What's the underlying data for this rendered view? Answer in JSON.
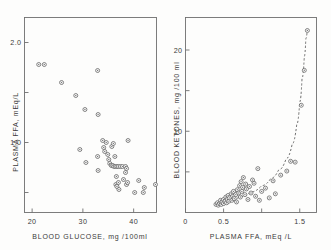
{
  "figure": {
    "background_color": "#fdfdfc",
    "axis_color": "#6f6f6f",
    "marker_color": "#5c5c5c",
    "curve_color": "#555555"
  },
  "chart_data": [
    {
      "type": "scatter",
      "panel": "left",
      "title": "",
      "xlabel": "BLOOD GLUCOSE, mg /100ml",
      "ylabel": "PLASMA FFA, mEq/L",
      "xlim": [
        18.5,
        44.5
      ],
      "ylim": [
        0.3,
        2.25
      ],
      "xticks": [
        20,
        30,
        40
      ],
      "xticklabels": [
        "20",
        "30",
        "40"
      ],
      "yticks": [
        0.5,
        1.0,
        1.5,
        2.0
      ],
      "yticklabels": [
        "",
        "1.0",
        "",
        "2.0"
      ],
      "grid": false,
      "legend": "none",
      "points": [
        [
          21.3,
          1.78
        ],
        [
          22.4,
          1.78
        ],
        [
          25.8,
          1.6
        ],
        [
          28.6,
          1.47
        ],
        [
          30.4,
          1.33
        ],
        [
          32.9,
          1.72
        ],
        [
          33.0,
          1.28
        ],
        [
          29.4,
          0.93
        ],
        [
          30.6,
          0.8
        ],
        [
          32.9,
          0.86
        ],
        [
          33.9,
          1.02
        ],
        [
          34.1,
          0.95
        ],
        [
          34.3,
          0.91
        ],
        [
          34.6,
          1.0
        ],
        [
          34.9,
          0.88
        ],
        [
          35.1,
          0.83
        ],
        [
          35.3,
          0.79
        ],
        [
          35.6,
          0.77
        ],
        [
          35.9,
          0.77
        ],
        [
          36.1,
          0.76
        ],
        [
          36.4,
          0.76
        ],
        [
          36.7,
          0.76
        ],
        [
          37.0,
          0.76
        ],
        [
          37.4,
          0.76
        ],
        [
          37.8,
          0.76
        ],
        [
          38.4,
          0.76
        ],
        [
          33.0,
          0.72
        ],
        [
          35.7,
          0.96
        ],
        [
          36.0,
          0.99
        ],
        [
          36.3,
          0.86
        ],
        [
          36.6,
          0.66
        ],
        [
          36.5,
          0.58
        ],
        [
          36.7,
          0.56
        ],
        [
          37.0,
          0.6
        ],
        [
          37.1,
          0.53
        ],
        [
          38.0,
          0.63
        ],
        [
          38.4,
          0.7
        ],
        [
          38.6,
          0.58
        ],
        [
          38.8,
          0.6
        ],
        [
          38.9,
          1.02
        ],
        [
          38.6,
          0.74
        ],
        [
          40.2,
          0.5
        ],
        [
          41.0,
          0.62
        ],
        [
          41.9,
          0.5
        ],
        [
          42.1,
          0.55
        ],
        [
          44.3,
          0.58
        ]
      ]
    },
    {
      "type": "scatter",
      "panel": "right",
      "title": "",
      "xlabel": "PLASMA FFA, mEq /L",
      "ylabel": "BLOOD KETONES, mg /100 ml",
      "xlim": [
        0.0,
        1.72
      ],
      "ylim": [
        0,
        24
      ],
      "xticks": [
        0,
        0.5,
        1.0,
        1.5
      ],
      "xticklabels": [
        "0",
        "0.5",
        "",
        "1.5"
      ],
      "yticks": [
        5,
        10,
        15,
        20
      ],
      "yticklabels": [
        "",
        "10",
        "",
        "20"
      ],
      "grid": false,
      "legend": "none",
      "fit_curve": {
        "style": "dashed",
        "description": "exponential rise fitted through scatter",
        "points": [
          [
            0.42,
            0.9
          ],
          [
            0.55,
            1.3
          ],
          [
            0.7,
            1.9
          ],
          [
            0.85,
            2.5
          ],
          [
            1.0,
            3.3
          ],
          [
            1.12,
            4.2
          ],
          [
            1.22,
            5.2
          ],
          [
            1.32,
            6.6
          ],
          [
            1.4,
            8.4
          ],
          [
            1.46,
            10.8
          ],
          [
            1.5,
            13.6
          ],
          [
            1.53,
            16.5
          ],
          [
            1.56,
            19.2
          ],
          [
            1.58,
            21.4
          ],
          [
            1.6,
            22.6
          ]
        ]
      },
      "points": [
        [
          0.4,
          1.0
        ],
        [
          0.42,
          1.2
        ],
        [
          0.43,
          0.9
        ],
        [
          0.45,
          1.1
        ],
        [
          0.46,
          1.5
        ],
        [
          0.47,
          1.0
        ],
        [
          0.48,
          1.3
        ],
        [
          0.5,
          1.6
        ],
        [
          0.5,
          1.1
        ],
        [
          0.52,
          1.4
        ],
        [
          0.53,
          1.9
        ],
        [
          0.54,
          1.2
        ],
        [
          0.55,
          1.6
        ],
        [
          0.56,
          2.1
        ],
        [
          0.57,
          1.4
        ],
        [
          0.58,
          1.8
        ],
        [
          0.6,
          2.3
        ],
        [
          0.61,
          1.5
        ],
        [
          0.62,
          2.0
        ],
        [
          0.63,
          2.6
        ],
        [
          0.64,
          1.7
        ],
        [
          0.66,
          2.2
        ],
        [
          0.67,
          1.3
        ],
        [
          0.68,
          2.8
        ],
        [
          0.7,
          2.4
        ],
        [
          0.71,
          3.3
        ],
        [
          0.72,
          1.9
        ],
        [
          0.73,
          3.8
        ],
        [
          0.74,
          2.6
        ],
        [
          0.75,
          3.1
        ],
        [
          0.76,
          4.3
        ],
        [
          0.78,
          2.2
        ],
        [
          0.79,
          3.5
        ],
        [
          0.8,
          2.9
        ],
        [
          0.82,
          1.6
        ],
        [
          0.84,
          3.2
        ],
        [
          0.86,
          2.4
        ],
        [
          0.88,
          4.0
        ],
        [
          0.9,
          3.6
        ],
        [
          0.92,
          2.0
        ],
        [
          0.95,
          5.4
        ],
        [
          0.97,
          1.5
        ],
        [
          1.0,
          2.6
        ],
        [
          1.05,
          3.0
        ],
        [
          1.1,
          1.8
        ],
        [
          1.15,
          3.9
        ],
        [
          1.18,
          2.3
        ],
        [
          1.25,
          4.6
        ],
        [
          1.33,
          5.1
        ],
        [
          1.38,
          6.3
        ],
        [
          1.44,
          6.2
        ],
        [
          1.52,
          13.2
        ],
        [
          1.56,
          17.5
        ],
        [
          1.6,
          22.4
        ]
      ]
    }
  ]
}
